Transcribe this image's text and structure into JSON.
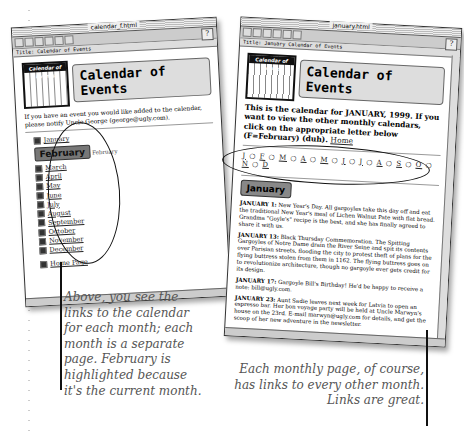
{
  "left_window": {
    "title": "calendar_f.html",
    "title_field": "Title: Calendar of Events",
    "banner": {
      "icon_label": "Calendar of Events",
      "heading": "Calendar of Events"
    },
    "intro": "If you have an event you would like added to the calendar, please notify Uncle George (george@ugly.com).",
    "months_before": [
      {
        "label": "January"
      }
    ],
    "current_month": {
      "badge": "February",
      "label": "February"
    },
    "months_after": [
      {
        "label": "March"
      },
      {
        "label": "April"
      },
      {
        "label": "May"
      },
      {
        "label": "June"
      },
      {
        "label": "July"
      },
      {
        "label": "August"
      },
      {
        "label": "September"
      },
      {
        "label": "October"
      },
      {
        "label": "November"
      },
      {
        "label": "December"
      }
    ],
    "home_link": "Home Page"
  },
  "right_window": {
    "title": "january.html",
    "title_field": "Title: January Calendar of Events",
    "banner": {
      "icon_label": "Calendar of Events",
      "heading": "Calendar of Events"
    },
    "intro": "This is the calendar for JANUARY, 1999. If you want to view the other monthly calendars, click on the appropriate letter below (F=February) (duh).",
    "home_link": "Home",
    "month_letters": [
      "J",
      "F",
      "M",
      "A",
      "M",
      "J",
      "J",
      "A",
      "S",
      "O",
      "N",
      "D"
    ],
    "section_heading": "January",
    "events": [
      {
        "date": "JANUARY 1:",
        "text": "New Year's Day. All gargoyles take this day off and eat the traditional New Year's meal of Lichen Walnut Pate with flat bread. Grandma \"Goyle's\" recipe is the best, and she has finally agreed to share it with us."
      },
      {
        "date": "JANUARY 13:",
        "text": "Black Thursday Commemoration. The Spitting Gargoyles of Notre Dame drain the River Seine and spit its contents over Parisian streets, flooding the city to protest theft of plans for the flying buttress stolen from them in 1162. The flying buttress goes on to revolutionize architecture, though no gargoyle ever gets credit for its design."
      },
      {
        "date": "JANUARY 17:",
        "text": "Gargoyle Bill's Birthday! He'd be happy to receive a note: bill@ugly.com."
      },
      {
        "date": "JANUARY 23:",
        "text": "Aunt Sadie leaves next week for Latvia to open an espresso bar. Her bon voyage party will be held at Uncle Marwyn's house on the 23rd. E-mail marwyn@ugly.com for details, and get the scoop of her new adventure in the newsletter."
      }
    ]
  },
  "captions": {
    "left": "Above, you see the links to the calendar for each month; each month is a separate page. February is highlighted because it's the current month.",
    "right": "Each monthly page, of course, has links to every other month. Links are great."
  }
}
